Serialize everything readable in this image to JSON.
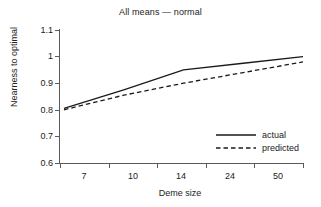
{
  "chart_data": {
    "type": "line",
    "title": "All means — normal",
    "xlabel": "Deme size",
    "ylabel": "Nearness to optimal",
    "categories": [
      "7",
      "10",
      "14",
      "24",
      "50"
    ],
    "series": [
      {
        "name": "actual",
        "style": "solid",
        "values": [
          0.805,
          0.875,
          0.95,
          0.975,
          1.0
        ]
      },
      {
        "name": "predicted",
        "style": "dashed",
        "values": [
          0.8,
          0.855,
          0.9,
          0.94,
          0.98
        ]
      }
    ],
    "ylim": [
      0.6,
      1.1
    ],
    "yticks": [
      "0.6",
      "0.7",
      "0.8",
      "0.9",
      "1",
      "1.1"
    ],
    "grid": false,
    "legend_position": "lower-right",
    "line_color": "#1a1a1a",
    "axis_color": "#5a5a5a"
  },
  "legend": {
    "actual_label": "actual",
    "predicted_label": "predicted"
  },
  "axis": {
    "y_labels": [
      "1.1",
      "1",
      "0.9",
      "0.8",
      "0.7",
      "0.6"
    ],
    "x_labels": [
      "7",
      "10",
      "14",
      "24",
      "50"
    ]
  }
}
